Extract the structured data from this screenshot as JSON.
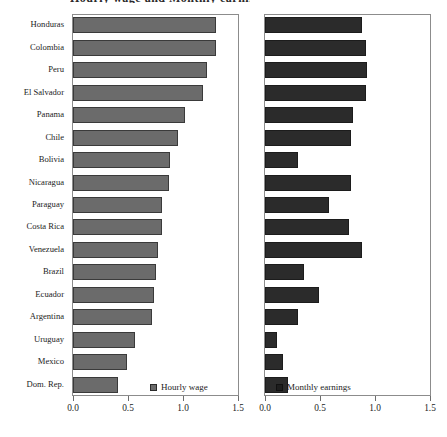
{
  "figure": {
    "title_clipped": "Hourly wage and Monthly earnings"
  },
  "panels": {
    "left": {
      "legend_label": "Hourly wage",
      "legend_swatch": "square-light-gray-icon",
      "axis": {
        "ticks": [
          "0.0",
          "0.5",
          "1.0",
          "1.5"
        ],
        "min": 0.0,
        "max": 1.5
      }
    },
    "right": {
      "legend_label": "Monthly earnings",
      "legend_swatch": "square-dark-icon",
      "axis": {
        "ticks": [
          "0.0",
          "0.5",
          "1.0",
          "1.5"
        ],
        "min": 0.0,
        "max": 1.5
      }
    }
  },
  "chart_data": {
    "type": "bar",
    "title": "Hourly wage and Monthly earnings",
    "orientation": "horizontal",
    "subplots": 2,
    "grid": false,
    "xlabel": "",
    "ylabel": "",
    "xlim": [
      0.0,
      1.5
    ],
    "xticks": [
      0.0,
      0.5,
      1.0,
      1.5
    ],
    "legend_position": "bottom-right-inside",
    "categories": [
      "Honduras",
      "Colombia",
      "Peru",
      "El Salvador",
      "Panama",
      "Chile",
      "Bolivia",
      "Nicaragua",
      "Paraguay",
      "Costa Rica",
      "Venezuela",
      "Brazil",
      "Ecuador",
      "Argentina",
      "Uruguay",
      "Mexico",
      "Dom. Rep."
    ],
    "series": [
      {
        "name": "Hourly wage",
        "panel": "left",
        "color": "#6b6b6b",
        "values": [
          1.3,
          1.3,
          1.22,
          1.18,
          1.02,
          0.95,
          0.88,
          0.87,
          0.81,
          0.81,
          0.77,
          0.75,
          0.74,
          0.72,
          0.56,
          0.49,
          0.41
        ]
      },
      {
        "name": "Monthly earnings",
        "panel": "right",
        "color": "#2b2b2b",
        "values": [
          0.88,
          0.92,
          0.93,
          0.92,
          0.8,
          0.78,
          0.3,
          0.78,
          0.58,
          0.76,
          0.88,
          0.35,
          0.49,
          0.3,
          0.11,
          0.16,
          0.21
        ]
      }
    ]
  }
}
